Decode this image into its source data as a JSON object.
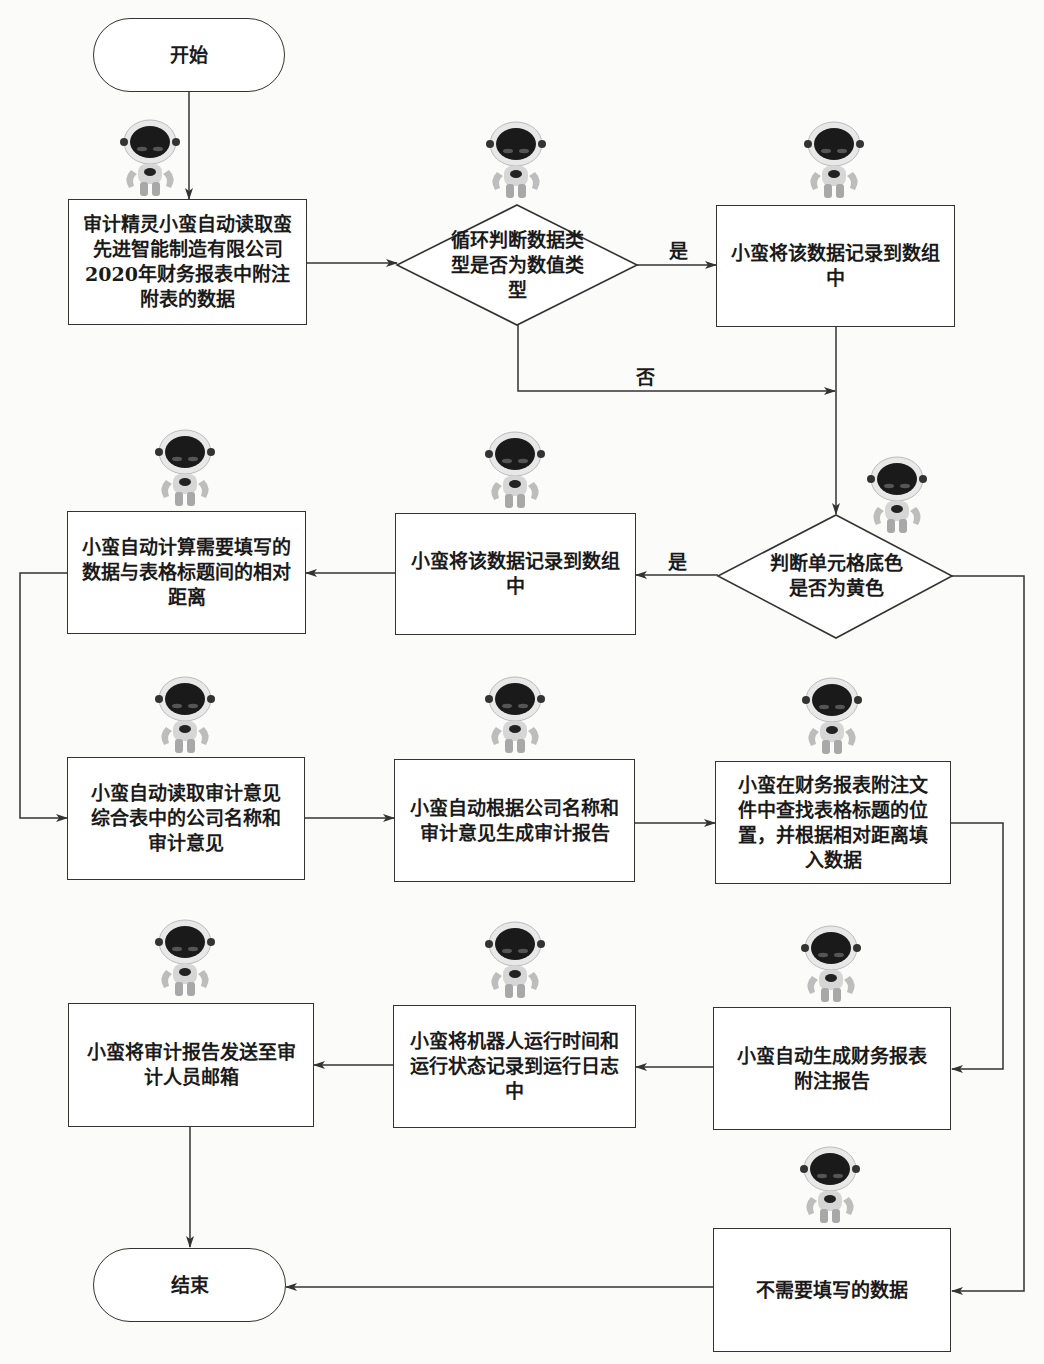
{
  "flowchart": {
    "nodes": {
      "start": "开始",
      "read_data": "审计精灵小蛮自动读取蛮先进智能制造有限公司2020年财务报表中附注附表的数据",
      "check_numeric": "循环判断数据类型是否为数值类型",
      "record_array_1": "小蛮将该数据记录到数组中",
      "check_yellow": "判断单元格底色是否为黄色",
      "record_array_2": "小蛮将该数据记录到数组中",
      "calc_distance": "小蛮自动计算需要填写的数据与表格标题间的相对距离",
      "read_opinion": "小蛮自动读取审计意见综合表中的公司名称和审计意见",
      "gen_audit_report": "小蛮自动根据公司名称和审计意见生成审计报告",
      "fill_data": "小蛮在财务报表附注文件中查找表格标题的位置，并根据相对距离填入数据",
      "send_email": "小蛮将审计报告发送至审计人员邮箱",
      "log_run": "小蛮将机器人运行时间和运行状态记录到运行日志中",
      "gen_notes_report": "小蛮自动生成财务报表附注报告",
      "no_fill": "不需要填写的数据",
      "end": "结束"
    },
    "edge_labels": {
      "numeric_yes": "是",
      "numeric_no": "否",
      "yellow_yes": "是"
    },
    "edges": [
      [
        "start",
        "read_data"
      ],
      [
        "read_data",
        "check_numeric"
      ],
      [
        "check_numeric",
        "record_array_1",
        "是"
      ],
      [
        "check_numeric",
        "check_yellow",
        "否"
      ],
      [
        "record_array_1",
        "check_yellow"
      ],
      [
        "check_yellow",
        "record_array_2",
        "是"
      ],
      [
        "check_yellow",
        "no_fill"
      ],
      [
        "record_array_2",
        "calc_distance"
      ],
      [
        "calc_distance",
        "read_opinion"
      ],
      [
        "read_opinion",
        "gen_audit_report"
      ],
      [
        "gen_audit_report",
        "fill_data"
      ],
      [
        "fill_data",
        "gen_notes_report"
      ],
      [
        "gen_notes_report",
        "log_run"
      ],
      [
        "log_run",
        "send_email"
      ],
      [
        "send_email",
        "end"
      ],
      [
        "no_fill",
        "end"
      ]
    ],
    "decoration": {
      "robot_icon_count": 13
    }
  }
}
